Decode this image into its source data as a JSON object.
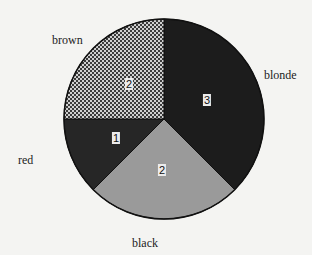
{
  "chart_data": {
    "type": "pie",
    "title": "",
    "categories": [
      "blonde",
      "black",
      "red",
      "brown"
    ],
    "values": [
      3,
      2,
      1,
      2
    ],
    "start_angle": "12 o'clock",
    "direction": "clockwise",
    "slice_fills": {
      "blonde": "#1c1c1c",
      "black": "#9a9a9a",
      "red": "#262626",
      "brown": "crosshatch"
    },
    "legend": "none",
    "value_labels_shown": true
  },
  "labels": {
    "brown": "brown",
    "blonde": "blonde",
    "red": "red",
    "black": "black"
  },
  "values": {
    "blonde": "3",
    "black": "2",
    "red": "1",
    "brown": "2"
  }
}
